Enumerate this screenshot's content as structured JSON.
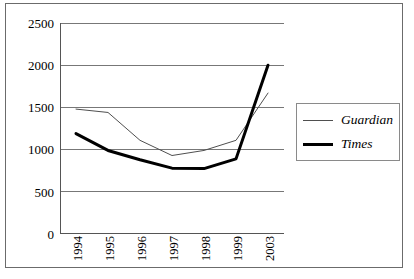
{
  "chart_data": {
    "type": "line",
    "title": "",
    "subtitle": "",
    "xlabel": "",
    "ylabel": "",
    "categories": [
      "1994",
      "1995",
      "1996",
      "1997",
      "1998",
      "1999",
      "2003"
    ],
    "ylim": [
      0,
      2500
    ],
    "yticks": [
      0,
      500,
      1000,
      1500,
      2000,
      2500
    ],
    "ytick_labels": [
      "0",
      "500",
      "1000",
      "1500",
      "2000",
      "2500"
    ],
    "grid": "horizontal",
    "legend_position": "right",
    "xtick_rotation": 90,
    "series": [
      {
        "name": "Guardian",
        "values": [
          1480,
          1440,
          1110,
          930,
          990,
          1110,
          1670
        ],
        "color": "#4f4f4f",
        "line_width": 1
      },
      {
        "name": "Times",
        "values": [
          1190,
          990,
          880,
          780,
          775,
          890,
          2000
        ],
        "color": "#000000",
        "line_width": 3
      }
    ]
  },
  "legend": {
    "entries": [
      {
        "label": "Guardian",
        "style": "thin"
      },
      {
        "label": "Times",
        "style": "thick"
      }
    ]
  },
  "axes": {
    "axis_color": "#555555",
    "grid_color": "#777777",
    "frame_color": "#6b6b6b"
  }
}
